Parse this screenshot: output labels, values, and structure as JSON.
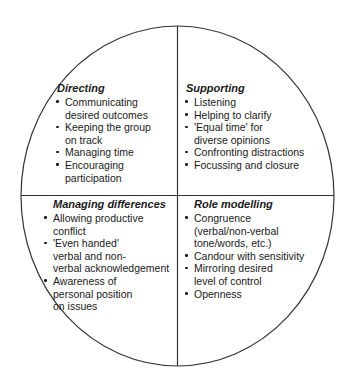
{
  "diagram": {
    "shape": "circle-divided-into-four-quadrants",
    "stroke_color": "#333333",
    "background_color": "#ffffff",
    "bullet_glyph": "•",
    "geometry": {
      "circle_left": 21,
      "circle_top": 26,
      "circle_right": 334,
      "circle_bottom": 366,
      "center_x": 177,
      "center_y": 196
    },
    "quadrants": [
      {
        "id": "directing",
        "position": "top-left",
        "title": "Directing",
        "items": [
          "Communicating desired outcomes",
          "Keeping the group on track",
          "Managing time",
          "Encouraging participation"
        ],
        "lines": [
          [
            "Communicating",
            "desired outcomes"
          ],
          [
            "Keeping the group",
            "on track"
          ],
          [
            "Managing time"
          ],
          [
            "Encouraging",
            "participation"
          ]
        ]
      },
      {
        "id": "supporting",
        "position": "top-right",
        "title": "Supporting",
        "items": [
          "Listening",
          "Helping to clarify",
          "'Equal time' for diverse opinions",
          "Confronting distractions",
          "Focussing and closure"
        ],
        "lines": [
          [
            "Listening"
          ],
          [
            "Helping to clarify"
          ],
          [
            "'Equal time' for",
            "diverse opinions"
          ],
          [
            "Confronting distractions"
          ],
          [
            "Focussing and closure"
          ]
        ]
      },
      {
        "id": "managing-differences",
        "position": "bottom-left",
        "title": "Managing differences",
        "items": [
          "Allowing productive conflict",
          "'Even handed' verbal and non-verbal acknowledgement",
          "Awareness of personal position on issues"
        ],
        "lines": [
          [
            "Allowing productive",
            "conflict"
          ],
          [
            "'Even handed'",
            "verbal and non-",
            "verbal acknowledgement"
          ],
          [
            "Awareness of",
            "personal position",
            "on issues"
          ]
        ]
      },
      {
        "id": "role-modelling",
        "position": "bottom-right",
        "title": "Role modelling",
        "items": [
          "Congruence (verbal/non-verbal tone/words, etc.)",
          "Candour with sensitivity",
          "Mirroring desired level of control",
          "Openness"
        ],
        "lines": [
          [
            "Congruence",
            "(verbal/non-verbal",
            "tone/words, etc.)"
          ],
          [
            "Candour with sensitivity"
          ],
          [
            "Mirroring desired",
            "level of control"
          ],
          [
            "Openness"
          ]
        ]
      }
    ]
  }
}
